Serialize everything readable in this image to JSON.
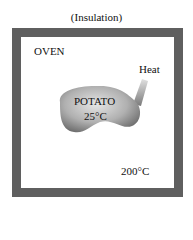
{
  "diagram": {
    "insulation_label": "(Insulation)",
    "oven_label": "OVEN",
    "heat_label": "Heat",
    "potato": {
      "label": "POTATO",
      "temperature": "25°C"
    },
    "oven_temperature": "200°C"
  }
}
